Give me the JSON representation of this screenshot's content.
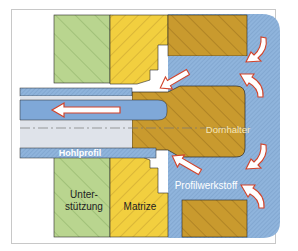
{
  "diagram": {
    "type": "cross-section",
    "labels": {
      "dornhalter": "Dornhalter",
      "hohlprofil": "Hohlprofil",
      "unterstuetzung_line1": "Unter-",
      "unterstuetzung_line2": "stützung",
      "matrize": "Matrize",
      "profilwerkstoff": "Profilwerkstoff"
    },
    "colors": {
      "frame": "#c8c8c8",
      "support_green": "#b9d58f",
      "die_yellow": "#f2cf3f",
      "holder_brown": "#c99a2e",
      "material_blue": "#8fb4dc",
      "profile_interior": "#dfe3ea",
      "mandrel_blue": "#7fa8d8",
      "arrow_fill": "#ffffff",
      "arrow_stroke": "#d2432a",
      "outline": "#2a2a2a",
      "label_light": "#ffffff",
      "label_dark": "#222222"
    },
    "arrows": [
      {
        "name": "profile-exit-arrow",
        "direction": "left"
      },
      {
        "name": "material-flow-arrow-upper-diagonal",
        "direction": "down-left"
      },
      {
        "name": "material-flow-arrow-lower-diagonal",
        "direction": "up-left"
      },
      {
        "name": "material-flow-arrow-top-right-upper",
        "direction": "down-left"
      },
      {
        "name": "material-flow-arrow-top-right-lower",
        "direction": "up"
      },
      {
        "name": "material-flow-arrow-bottom-right-upper",
        "direction": "down-left"
      },
      {
        "name": "material-flow-arrow-bottom-right-lower",
        "direction": "up"
      }
    ]
  }
}
